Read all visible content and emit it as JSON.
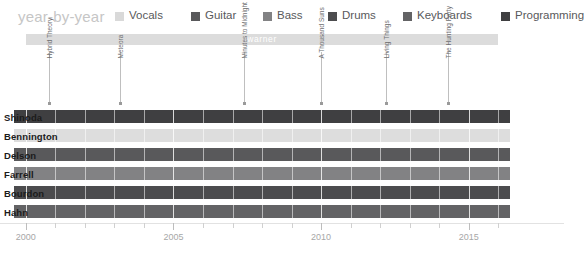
{
  "header": {
    "title": "year-by-year"
  },
  "legend": {
    "items": [
      {
        "label": "Vocals",
        "color": "#d9d9d9"
      },
      {
        "label": "Guitar",
        "color": "#59595b"
      },
      {
        "label": "Bass",
        "color": "#828284"
      },
      {
        "label": "Drums",
        "color": "#4c4c4e"
      },
      {
        "label": "Keyboards",
        "color": "#636365"
      },
      {
        "label": "Programming",
        "color": "#3f3f41"
      }
    ]
  },
  "era": {
    "label": "warner",
    "start": 2000.0,
    "end": 2016.0,
    "color": "#dcdcdc"
  },
  "albums": [
    {
      "label": "Hybrid Theory",
      "year": 2000.8
    },
    {
      "label": "Meteora",
      "year": 2003.2
    },
    {
      "label": "Minutes to Midnight",
      "year": 2007.4
    },
    {
      "label": "A Thousand Suns",
      "year": 2010.0
    },
    {
      "label": "Living Things",
      "year": 2012.2
    },
    {
      "label": "The Hunting Party",
      "year": 2014.3
    }
  ],
  "members": [
    {
      "name": "Shinoda",
      "role": "Programming",
      "color": "#3f3f41",
      "start": 1999.6,
      "end": 2016.4
    },
    {
      "name": "Bennington",
      "role": "Vocals",
      "color": "#dddddd",
      "start": 1999.6,
      "end": 2016.4
    },
    {
      "name": "Delson",
      "role": "Guitar",
      "color": "#59595b",
      "start": 1999.6,
      "end": 2016.4
    },
    {
      "name": "Farrell",
      "role": "Bass",
      "color": "#828284",
      "start": 1999.6,
      "end": 2016.4
    },
    {
      "name": "Bourdon",
      "role": "Drums",
      "color": "#4c4c4e",
      "start": 1999.6,
      "end": 2016.4
    },
    {
      "name": "Hahn",
      "role": "Keyboards",
      "color": "#636365",
      "start": 1999.6,
      "end": 2016.4
    }
  ],
  "axis": {
    "min": 1999.6,
    "max": 2016.6,
    "major_ticks": [
      2000,
      2005,
      2010,
      2015
    ],
    "minor_ticks": [
      2001,
      2002,
      2003,
      2004,
      2006,
      2007,
      2008,
      2009,
      2011,
      2012,
      2013,
      2014,
      2016
    ],
    "tick_labels": [
      "2000",
      "2005",
      "2010",
      "2015"
    ]
  },
  "chart_data": {
    "type": "bar",
    "title": "year-by-year",
    "xlabel": "",
    "ylabel": "",
    "xlim": [
      1999.6,
      2016.6
    ],
    "grid": true,
    "legend_position": "top-right",
    "categories": [
      "Shinoda",
      "Bennington",
      "Delson",
      "Farrell",
      "Bourdon",
      "Hahn"
    ],
    "series": [
      {
        "name": "Programming",
        "values": [
          16.8,
          0,
          0,
          0,
          0,
          0
        ]
      },
      {
        "name": "Vocals",
        "values": [
          0,
          16.8,
          0,
          0,
          0,
          0
        ]
      },
      {
        "name": "Guitar",
        "values": [
          0,
          0,
          16.8,
          0,
          0,
          0
        ]
      },
      {
        "name": "Bass",
        "values": [
          0,
          0,
          0,
          16.8,
          0,
          0
        ]
      },
      {
        "name": "Drums",
        "values": [
          0,
          0,
          0,
          0,
          16.8,
          0
        ]
      },
      {
        "name": "Keyboards",
        "values": [
          0,
          0,
          0,
          0,
          0,
          16.8
        ]
      }
    ],
    "annotations": [
      "warner",
      "Hybrid Theory",
      "Meteora",
      "Minutes to Midnight",
      "A Thousand Suns",
      "Living Things",
      "The Hunting Party"
    ]
  }
}
